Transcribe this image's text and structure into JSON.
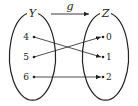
{
  "diagram": {
    "domain_set": {
      "label": "Y",
      "elements": [
        "4",
        "5",
        "6"
      ]
    },
    "codomain_set": {
      "label": "Z",
      "elements": [
        "0",
        "1",
        "2"
      ]
    },
    "function": {
      "label": "g",
      "mappings": [
        {
          "from": "4",
          "to": "1"
        },
        {
          "from": "5",
          "to": "0"
        },
        {
          "from": "6",
          "to": "2"
        }
      ]
    },
    "colors": {
      "stroke": "#222222",
      "background": "#ffffff"
    }
  }
}
